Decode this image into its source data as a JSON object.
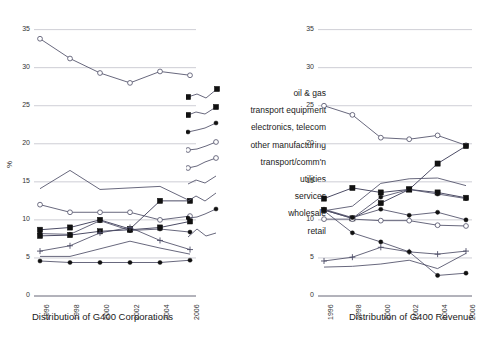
{
  "figure": {
    "ylabel": "%",
    "yticks": [
      0,
      5,
      10,
      15,
      20,
      25,
      30,
      35
    ],
    "xticks": [
      "1996",
      "1998",
      "2000",
      "2002",
      "2004",
      "2006"
    ],
    "legend_title": "",
    "grid": "horizontal",
    "legend_position": "center",
    "colors": {
      "line": "#4d4d66",
      "grid": "#c8c8d0",
      "axis": "#666677",
      "text": "#1a1a1a",
      "marker_fill_dark": "#111111",
      "marker_fill_open": "#ffffff"
    }
  },
  "legend": {
    "items": [
      {
        "label": "oil & gas",
        "marker": "filled-square"
      },
      {
        "label": "transport equipment",
        "marker": "filled-square"
      },
      {
        "label": "electronics, telecom",
        "marker": "filled-circle"
      },
      {
        "label": "other manufacturing",
        "marker": "open-circle"
      },
      {
        "label": "transport/comm'n",
        "marker": "open-circle"
      },
      {
        "label": "utilities",
        "marker": "none"
      },
      {
        "label": "services",
        "marker": "none"
      },
      {
        "label": "wholesale",
        "marker": "filled-circle"
      },
      {
        "label": "retail",
        "marker": "none"
      }
    ]
  },
  "chart_data": [
    {
      "type": "line",
      "title": "",
      "xlabel": "Distribution of G400 Corporations",
      "ylabel": "%",
      "x": [
        "1996",
        "1998",
        "2000",
        "2002",
        "2004",
        "2006"
      ],
      "ylim": [
        0,
        36
      ],
      "yticks": [
        0,
        5,
        10,
        15,
        20,
        25,
        30,
        35
      ],
      "grid": true,
      "series": [
        {
          "name": "retail",
          "marker": "open-circle",
          "values": [
            33.8,
            31.2,
            29.3,
            28.0,
            29.5,
            29.0
          ]
        },
        {
          "name": "services",
          "marker": "none",
          "values": [
            14.1,
            16.5,
            14.0,
            14.2,
            14.4,
            12.5
          ]
        },
        {
          "name": "other manufacturing",
          "marker": "open-circle",
          "values": [
            12.0,
            11.0,
            11.0,
            11.0,
            10.0,
            10.5
          ]
        },
        {
          "name": "oil & gas",
          "marker": "filled-square",
          "values": [
            8.7,
            9.0,
            10.0,
            8.8,
            12.5,
            12.5
          ]
        },
        {
          "name": "transport equipment",
          "marker": "filled-square",
          "values": [
            7.9,
            8.0,
            8.5,
            8.7,
            9.0,
            9.8
          ]
        },
        {
          "name": "electronics, telecom",
          "marker": "filled-circle",
          "values": [
            8.2,
            8.1,
            9.9,
            8.6,
            8.8,
            8.4
          ]
        },
        {
          "name": "transport/comm'n",
          "marker": "plus",
          "values": [
            5.9,
            6.6,
            8.3,
            9.0,
            7.3,
            6.1
          ]
        },
        {
          "name": "utilities",
          "marker": "none",
          "values": [
            5.2,
            5.2,
            6.2,
            7.2,
            6.3,
            5.5
          ]
        },
        {
          "name": "wholesale",
          "marker": "filled-circle",
          "values": [
            4.6,
            4.4,
            4.4,
            4.4,
            4.4,
            4.7
          ]
        }
      ]
    },
    {
      "type": "line",
      "title": "",
      "xlabel": "Distribution of G400 Revenue",
      "ylabel": "%",
      "x": [
        "1996",
        "1998",
        "2000",
        "2002",
        "2004",
        "2006"
      ],
      "ylim": [
        0,
        36
      ],
      "yticks": [
        0,
        5,
        10,
        15,
        20,
        25,
        30,
        35
      ],
      "grid": true,
      "series": [
        {
          "name": "retail",
          "marker": "open-circle",
          "values": [
            25.0,
            23.8,
            20.8,
            20.6,
            21.1,
            19.8
          ]
        },
        {
          "name": "oil & gas",
          "marker": "filled-square",
          "values": [
            11.3,
            10.2,
            12.2,
            14.0,
            17.4,
            19.7
          ]
        },
        {
          "name": "transport equipment",
          "marker": "filled-square",
          "values": [
            12.8,
            14.2,
            13.6,
            14.0,
            13.6,
            12.9
          ]
        },
        {
          "name": "electronics, telecom",
          "marker": "filled-circle",
          "values": [
            11.3,
            10.2,
            13.0,
            14.0,
            13.4,
            12.8
          ]
        },
        {
          "name": "other manufacturing",
          "marker": "open-circle",
          "values": [
            10.1,
            10.1,
            9.9,
            9.9,
            9.3,
            9.2
          ]
        },
        {
          "name": "services",
          "marker": "none",
          "values": [
            11.2,
            11.8,
            14.8,
            15.4,
            15.5,
            14.5
          ]
        },
        {
          "name": "utilities",
          "marker": "filled-circle",
          "values": [
            11.4,
            10.3,
            11.4,
            10.6,
            11.0,
            10.0
          ]
        },
        {
          "name": "transport/comm'n",
          "marker": "plus",
          "values": [
            4.6,
            5.1,
            6.4,
            5.8,
            5.5,
            5.9
          ]
        },
        {
          "name": "wholesale",
          "marker": "filled-circle",
          "values": [
            11.2,
            8.3,
            7.1,
            5.8,
            2.7,
            3.0
          ]
        },
        {
          "name": "wholesale-lower",
          "marker": "none",
          "values": [
            3.8,
            3.9,
            4.2,
            4.7,
            3.6,
            5.6
          ]
        }
      ]
    }
  ]
}
